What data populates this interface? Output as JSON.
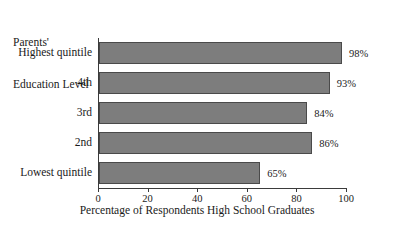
{
  "chart_data": {
    "type": "bar",
    "orientation": "horizontal",
    "title": "",
    "category_axis_title_lines": [
      "Parents'",
      "Education Level"
    ],
    "categories": [
      "Highest quintile",
      "4th",
      "3rd",
      "2nd",
      "Lowest quintile"
    ],
    "values": [
      98,
      93,
      84,
      86,
      65
    ],
    "value_labels": [
      "98%",
      "93%",
      "84%",
      "86%",
      "65%"
    ],
    "xlabel": "Percentage of Respondents High School Graduates",
    "ylabel": "",
    "xlim": [
      0,
      100
    ],
    "xticks": [
      0,
      20,
      40,
      60,
      80,
      100
    ],
    "xtick_labels": [
      "0",
      "20",
      "40",
      "60",
      "80",
      "100"
    ],
    "grid": false,
    "legend": false,
    "bar_color": "#7d7d7d",
    "bar_edge_color": "#4a4a4a",
    "axis_color": "#3b3b3b",
    "background": "#ffffff"
  }
}
